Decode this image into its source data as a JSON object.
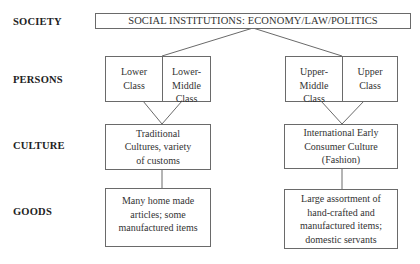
{
  "row_labels": {
    "society": "SOCIETY",
    "persons": "PERSONS",
    "culture": "CULTURE",
    "goods": "GOODS"
  },
  "society_box": "SOCIAL INSTITUTIONS: ECONOMY/LAW/POLITICS",
  "persons": {
    "lower_class": [
      "Lower",
      "Class"
    ],
    "lower_middle_class": [
      "Lower-",
      "Middle",
      "Class"
    ],
    "upper_middle_class": [
      "Upper-",
      "Middle",
      "Class"
    ],
    "upper_class": [
      "Upper",
      "Class"
    ]
  },
  "culture": {
    "left": [
      "Traditional",
      "Cultures, variety",
      "of customs"
    ],
    "right": [
      "International Early",
      "Consumer Culture",
      "(Fashion)"
    ]
  },
  "goods": {
    "left": [
      "Many home made",
      "articles; some",
      "manufactured items"
    ],
    "right": [
      "Large assortment of",
      "hand-crafted and",
      "manufactured items;",
      "domestic servants"
    ]
  },
  "colors": {
    "line": "#6a6a6a",
    "text": "#333333",
    "background": "#ffffff"
  }
}
